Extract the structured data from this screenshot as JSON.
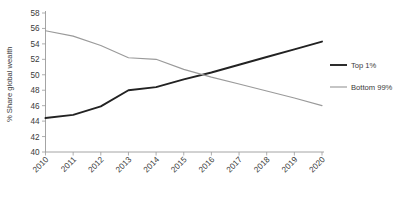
{
  "chart_data": {
    "type": "line",
    "title": "",
    "xlabel": "",
    "ylabel": "% Share global wealth",
    "x": [
      2010,
      2011,
      2012,
      2013,
      2014,
      2015,
      2016,
      2017,
      2018,
      2019,
      2020
    ],
    "categories": [
      "2010",
      "2011",
      "2012",
      "2013",
      "2014",
      "2015",
      "2016",
      "2017",
      "2018",
      "2019",
      "2020"
    ],
    "series": [
      {
        "name": "Top 1%",
        "color": "#222222",
        "values": [
          44.4,
          44.8,
          45.9,
          48.0,
          48.4,
          49.4,
          50.3,
          51.3,
          52.3,
          53.3,
          54.3
        ]
      },
      {
        "name": "Bottom 99%",
        "color": "#9a9a9a",
        "values": [
          55.7,
          55.0,
          53.8,
          52.2,
          52.0,
          50.7,
          49.7,
          48.8,
          47.9,
          47.0,
          46.0
        ]
      }
    ],
    "ylim": [
      40,
      58
    ],
    "yticks": [
      40,
      42,
      44,
      46,
      48,
      50,
      52,
      54,
      56,
      58
    ],
    "ytick_labels": [
      "40",
      "42",
      "44",
      "46",
      "48",
      "50",
      "52",
      "54",
      "56",
      "58"
    ],
    "xlim": [
      2010,
      2020
    ],
    "grid": false,
    "legend_position": "right"
  },
  "legend": {
    "items": [
      {
        "label": "Top 1%",
        "color": "#222222"
      },
      {
        "label": "Bottom 99%",
        "color": "#9a9a9a"
      }
    ]
  },
  "axes": {
    "y_title": "% Share global wealth"
  }
}
